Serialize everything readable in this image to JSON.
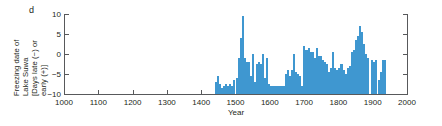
{
  "panel": {
    "label": "d"
  },
  "colors": {
    "bar": "#3f97d0",
    "axis": "#58595b",
    "text": "#231f20"
  },
  "axis_label": {
    "y_line1": "Freezing date of",
    "y_line2": "Lake Suwa",
    "y_line3": "[Days late (−) or",
    "y_line4": "early (+)]",
    "x": "Year"
  },
  "chart_data": {
    "type": "bar",
    "title": "",
    "subtitle": "",
    "xlabel": "Year",
    "ylabel": "Freezing date of Lake Suwa [Days late (−) or early (+)]",
    "xlim": [
      1000,
      2000
    ],
    "ylim": [
      -10,
      10
    ],
    "xticks": [
      1000,
      1100,
      1200,
      1300,
      1400,
      1500,
      1600,
      1700,
      1800,
      1900,
      2000
    ],
    "yticks": [
      -10,
      -5,
      0,
      5,
      10
    ],
    "grid": false,
    "legend": null,
    "bar_baseline": -10,
    "note": "Bars are drawn from the bottom of the axis (-10). Data coverage begins at 1443 and ends at 1940.",
    "x": [
      1443,
      1449,
      1455,
      1461,
      1467,
      1473,
      1479,
      1485,
      1491,
      1497,
      1503,
      1509,
      1515,
      1521,
      1527,
      1533,
      1539,
      1545,
      1551,
      1557,
      1563,
      1569,
      1575,
      1581,
      1587,
      1593,
      1599,
      1605,
      1611,
      1617,
      1623,
      1629,
      1635,
      1641,
      1647,
      1653,
      1659,
      1665,
      1671,
      1677,
      1683,
      1689,
      1695,
      1701,
      1707,
      1713,
      1719,
      1725,
      1731,
      1737,
      1743,
      1749,
      1755,
      1761,
      1767,
      1773,
      1779,
      1785,
      1791,
      1797,
      1803,
      1809,
      1815,
      1821,
      1827,
      1833,
      1839,
      1845,
      1851,
      1857,
      1863,
      1869,
      1875,
      1881,
      1887,
      1893,
      1899,
      1905,
      1911,
      1917,
      1923,
      1929,
      1935
    ],
    "values": [
      -7.0,
      -5.5,
      -7.5,
      -8.5,
      -8.0,
      -7.5,
      -8.0,
      -7.5,
      -8.0,
      -6.5,
      -6.0,
      -1.0,
      4.0,
      9.5,
      -1.0,
      -2.0,
      -2.0,
      -5.5,
      0.0,
      -7.0,
      -2.5,
      -2.0,
      -2.5,
      0.0,
      -6.0,
      -1.0,
      -7.5,
      -8.0,
      -8.0,
      -8.0,
      -8.0,
      -8.0,
      -8.0,
      -8.0,
      -5.0,
      -4.0,
      -5.5,
      -4.0,
      0.0,
      -4.5,
      -5.0,
      -5.5,
      -8.0,
      2.0,
      1.0,
      1.5,
      0.5,
      0.5,
      -1.0,
      1.5,
      -0.5,
      -0.5,
      -1.5,
      -2.0,
      -2.5,
      -4.5,
      -3.5,
      0.5,
      -3.5,
      -4.0,
      -3.5,
      -2.5,
      -4.0,
      -5.0,
      -3.5,
      -3.0,
      0.5,
      1.0,
      3.5,
      4.5,
      7.0,
      5.5,
      2.5,
      0.0,
      -1.0,
      -10.0,
      -1.5,
      -2.0,
      -1.5,
      -6.5,
      -4.5,
      -1.5,
      -1.5
    ]
  }
}
